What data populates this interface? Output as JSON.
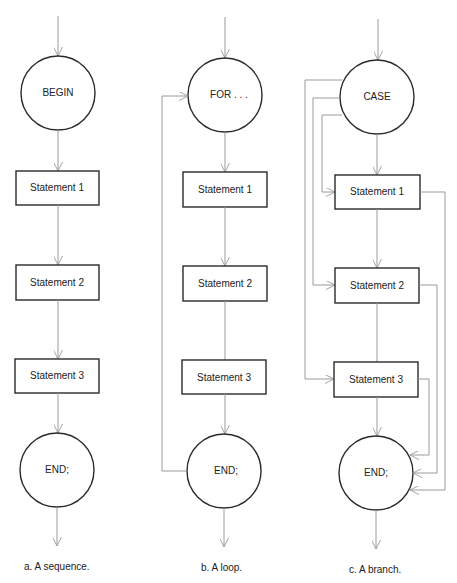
{
  "figures": [
    {
      "id": "a",
      "caption": "a. A sequence.",
      "start_node": "BEGIN",
      "statements": [
        "Statement 1",
        "Statement 2",
        "Statement 3"
      ],
      "end_node": "END;"
    },
    {
      "id": "b",
      "caption": "b. A loop.",
      "start_node": "FOR . . .",
      "statements": [
        "Statement 1",
        "Statement 2",
        "Statement 3"
      ],
      "end_node": "END;"
    },
    {
      "id": "c",
      "caption": "c. A branch.",
      "start_node": "CASE",
      "statements": [
        "Statement 1",
        "Statement 2",
        "Statement 3"
      ],
      "end_node": "END;"
    }
  ],
  "colors": {
    "shape_stroke": "#2a2a2a",
    "connector": "#9a9a9a",
    "background": "#ffffff"
  }
}
